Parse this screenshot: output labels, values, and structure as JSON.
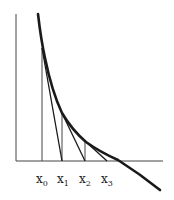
{
  "diagram": {
    "colors": {
      "ink": "#1a1a1a",
      "thin": "#444444",
      "background": "#ffffff"
    },
    "labels": [
      {
        "base": "x",
        "sub": "0",
        "x": 36,
        "y": 183
      },
      {
        "base": "x",
        "sub": "1",
        "x": 57,
        "y": 183
      },
      {
        "base": "x",
        "sub": "2",
        "x": 79,
        "y": 183
      },
      {
        "base": "x",
        "sub": "3",
        "x": 101,
        "y": 183
      }
    ],
    "axes": {
      "y_axis": {
        "x": 16,
        "y1": 14,
        "y2": 161
      },
      "x_axis": {
        "y": 161,
        "x1": 16,
        "x2": 163
      }
    },
    "curve": {
      "path": "M38 14 Q41 40 45 58 Q52 92 62 113 Q72 130 86 142 Q100 152 118 160 Q140 174 160 190"
    },
    "verticals": [
      {
        "x": 42,
        "y_top": 48
      },
      {
        "x": 62,
        "y_top": 113
      },
      {
        "x": 85,
        "y_top": 141
      }
    ],
    "tangents": [
      {
        "x1": 42,
        "y1": 48,
        "x2": 62,
        "y2": 161
      },
      {
        "x1": 62,
        "y1": 113,
        "x2": 85,
        "y2": 161
      },
      {
        "x1": 85,
        "y1": 141,
        "x2": 107,
        "y2": 161
      }
    ]
  }
}
